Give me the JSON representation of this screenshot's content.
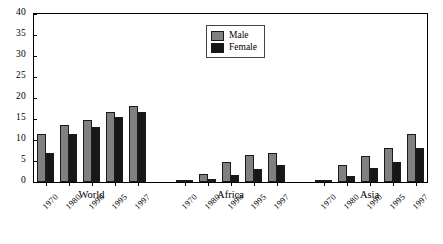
{
  "chart_data": {
    "type": "bar",
    "title": "",
    "xlabel": "",
    "ylabel": "",
    "ylim": [
      0,
      40
    ],
    "ytick_step": 5,
    "yticks": [
      "0",
      "5",
      "10",
      "15",
      "20",
      "25",
      "30",
      "35",
      "40"
    ],
    "grid": false,
    "legend_position": "top-center",
    "categories": [
      "1970",
      "1980",
      "1990",
      "1995",
      "1997"
    ],
    "groups": [
      {
        "name": "World",
        "categories": [
          "1970",
          "1980",
          "1990",
          "1995",
          "1997"
        ],
        "series": [
          {
            "name": "Male",
            "values": [
              11.5,
              13.5,
              14.7,
              16.7,
              18.2
            ]
          },
          {
            "name": "Female",
            "values": [
              7.0,
              11.5,
              13.0,
              15.5,
              16.7
            ]
          }
        ]
      },
      {
        "name": "Africa",
        "categories": [
          "1970",
          "1980",
          "1990",
          "1995",
          "1997"
        ],
        "series": [
          {
            "name": "Male",
            "values": [
              0.2,
              2.0,
              4.8,
              6.4,
              6.9
            ]
          },
          {
            "name": "Female",
            "values": [
              0.1,
              0.6,
              1.6,
              3.1,
              4.1
            ]
          }
        ]
      },
      {
        "name": "Asia",
        "categories": [
          "1970",
          "1980",
          "1990",
          "1995",
          "1997"
        ],
        "series": [
          {
            "name": "Male",
            "values": [
              0.2,
              4.1,
              6.3,
              8.0,
              11.5
            ]
          },
          {
            "name": "Female",
            "values": [
              0.1,
              1.5,
              3.3,
              4.8,
              8.2
            ]
          }
        ]
      }
    ],
    "series_names": [
      "Male",
      "Female"
    ],
    "colors": {
      "male": "#808080",
      "female": "#171717"
    }
  },
  "legend": {
    "items": [
      {
        "label": "Male",
        "key": "male"
      },
      {
        "label": "Female",
        "key": "female"
      }
    ]
  }
}
